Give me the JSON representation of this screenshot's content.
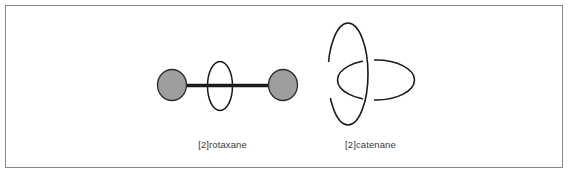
{
  "figure": {
    "background_color": "#ffffff",
    "frame_color": "#8a8a8a",
    "structures": [
      {
        "id": "rotaxane",
        "label": "[2]rotaxane",
        "description": "dumbbell axle with two filled stopper spheres threaded through one macrocycle ring",
        "components": [
          {
            "name": "left-stopper",
            "shape": "filled-circle",
            "fill_color": "#9e9e9e",
            "stroke_color": "#2b2b2b",
            "cx": 172,
            "cy": 85,
            "rx": 14,
            "ry": 15
          },
          {
            "name": "right-stopper",
            "shape": "filled-circle",
            "fill_color": "#9e9e9e",
            "stroke_color": "#2b2b2b",
            "cx": 283,
            "cy": 85,
            "rx": 14,
            "ry": 15
          },
          {
            "name": "axle-rod",
            "shape": "thick-line",
            "stroke_color": "#1a1a1a",
            "x1": 184,
            "y1": 85,
            "x2": 272,
            "y2": 85,
            "stroke_width": 3.2
          },
          {
            "name": "macrocycle-ring",
            "shape": "ellipse-outline",
            "stroke_color": "#1a1a1a",
            "cx": 220,
            "cy": 86,
            "rx": 12.5,
            "ry": 24.5,
            "stroke_width": 1.4
          }
        ]
      },
      {
        "id": "catenane",
        "label": "[2]catenane",
        "description": "two interlocked macrocycle rings, one vertical ellipse and one horizontal ellipse, mechanically linked",
        "components": [
          {
            "name": "vertical-ring",
            "shape": "ellipse-outline",
            "stroke_color": "#1a1a1a",
            "cx": 348,
            "cy": 74,
            "rx": 20,
            "ry": 51,
            "stroke_width": 1.5
          },
          {
            "name": "horizontal-ring",
            "shape": "ellipse-outline",
            "stroke_color": "#1a1a1a",
            "cx": 376,
            "cy": 80,
            "rx": 38,
            "ry": 20,
            "stroke_width": 1.5
          }
        ],
        "crossings": [
          {
            "name": "left-crossing",
            "over": "horizontal-ring",
            "under": "vertical-ring"
          },
          {
            "name": "right-crossing",
            "over": "vertical-ring",
            "under": "horizontal-ring"
          }
        ]
      }
    ]
  }
}
